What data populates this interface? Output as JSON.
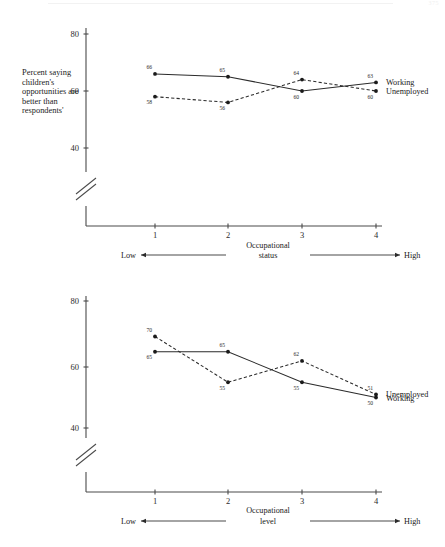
{
  "header": {
    "page_number": "375",
    "rule": "faded-top-rule"
  },
  "figures": [
    {
      "id": "top",
      "y_axis_label": "Percent saying children's opportunities are better than respondents'",
      "x_axis_caption_line1": "Occupational",
      "x_axis_caption_line2": "status",
      "x_low_label": "Low",
      "x_high_label": "High",
      "y_ticks": [
        "80",
        "60",
        "40"
      ],
      "x_ticks": [
        "1",
        "2",
        "3",
        "4"
      ],
      "legend": [
        "Working",
        "Unemployed"
      ]
    },
    {
      "id": "bottom",
      "y_axis_label": "Percent saying respondents' opportunities are better than parents'",
      "x_axis_caption_line1": "Occupational",
      "x_axis_caption_line2": "level",
      "x_low_label": "Low",
      "x_high_label": "High",
      "y_ticks": [
        "80",
        "60",
        "40"
      ],
      "x_ticks": [
        "1",
        "2",
        "3",
        "4"
      ],
      "legend": [
        "Unemployed",
        "Working"
      ]
    }
  ],
  "chart_data": [
    {
      "type": "line",
      "title": "",
      "xlabel": "Occupational status",
      "ylabel": "Percent saying children's opportunities are better than respondents'",
      "x": [
        1,
        2,
        3,
        4
      ],
      "xticklabels": [
        "1",
        "2",
        "3",
        "4"
      ],
      "ylim": [
        40,
        80
      ],
      "yticks": [
        40,
        60,
        80
      ],
      "y_axis_break": true,
      "grid": false,
      "legend_position": "right-inline",
      "annotations": [
        "Low",
        "High"
      ],
      "series": [
        {
          "name": "Working",
          "style": "solid",
          "values": [
            66,
            65,
            60,
            63
          ],
          "labels": [
            "66",
            "65",
            "60",
            "63"
          ]
        },
        {
          "name": "Unemployed",
          "style": "dashed",
          "values": [
            58,
            56,
            64,
            60
          ],
          "labels": [
            "58",
            "56",
            "64",
            "60"
          ]
        }
      ]
    },
    {
      "type": "line",
      "title": "",
      "xlabel": "Occupational level",
      "ylabel": "Percent saying respondents' opportunities are better than parents'",
      "x": [
        1,
        2,
        3,
        4
      ],
      "xticklabels": [
        "1",
        "2",
        "3",
        "4"
      ],
      "ylim": [
        40,
        80
      ],
      "yticks": [
        40,
        60,
        80
      ],
      "y_axis_break": true,
      "grid": false,
      "legend_position": "right-inline",
      "annotations": [
        "Low",
        "High"
      ],
      "series": [
        {
          "name": "Working",
          "style": "solid",
          "values": [
            65,
            65,
            55,
            50
          ],
          "labels": [
            "65",
            "65",
            "55",
            "50"
          ]
        },
        {
          "name": "Unemployed",
          "style": "dashed",
          "values": [
            70,
            55,
            62,
            51
          ],
          "labels": [
            "70",
            "55",
            "62",
            "51"
          ]
        }
      ]
    }
  ]
}
